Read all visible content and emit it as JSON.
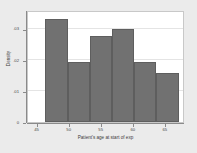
{
  "chart_data": {
    "type": "bar",
    "title": "",
    "subtitle": "",
    "xlabel": "Patient's age at start of exp",
    "ylabel": "Density",
    "xlim": [
      43.5,
      68.0
    ],
    "ylim": [
      0,
      0.036
    ],
    "grid": true,
    "legend": null,
    "x_ticks": [
      45,
      50,
      55,
      60,
      65
    ],
    "x_tick_labels": [
      "45",
      "50",
      "55",
      "60",
      "65"
    ],
    "y_ticks": [
      0,
      0.01,
      0.02,
      0.03
    ],
    "y_tick_labels": [
      "0",
      ".01",
      ".02",
      ".03"
    ],
    "bin_edges": [
      46.2,
      49.7,
      53.2,
      56.6,
      60.1,
      63.5,
      67.0
    ],
    "categories": [
      "46.2-49.7",
      "49.7-53.2",
      "53.2-56.6",
      "56.6-60.1",
      "60.1-63.5",
      "63.5-67.0"
    ],
    "values": [
      0.0331,
      0.0192,
      0.0276,
      0.0299,
      0.0192,
      0.0159
    ],
    "bar_color": "#717171",
    "bar_edge_color": "#5e5e5e",
    "panel_background": "#ffffff",
    "figure_background": "#ebebeb",
    "axis_color": "#8a8a8a"
  },
  "figure": {
    "background_color": "#ebebeb",
    "panel_color": "#ffffff"
  }
}
